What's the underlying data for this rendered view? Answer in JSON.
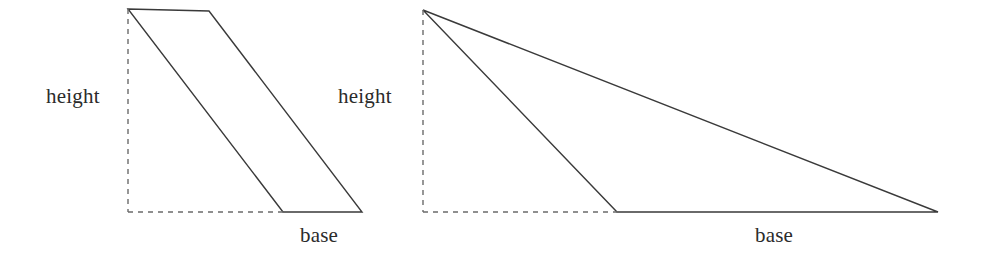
{
  "page": {
    "background_color": "#ffffff",
    "width": 983,
    "height": 262
  },
  "style": {
    "stroke_color": "#3a3a3a",
    "dashed_stroke_color": "#6b6b6b",
    "stroke_width": 1.4,
    "dash_pattern": "5,5",
    "label_color": "#2b2b2b",
    "label_font_size": 21
  },
  "figures": [
    {
      "id": "parallelogram",
      "name": "Parallelogram with base and height",
      "shape_type": "parallelogram",
      "vertices": [
        {
          "name": "top-left",
          "x": 128,
          "y": 9
        },
        {
          "name": "top-right",
          "x": 209,
          "y": 11
        },
        {
          "name": "bottom-right",
          "x": 362,
          "y": 212
        },
        {
          "name": "bottom-left",
          "x": 283,
          "y": 212
        }
      ],
      "height_line": {
        "x1": 128,
        "y1": 9,
        "x2": 128,
        "y2": 212,
        "dashed": true
      },
      "base_extension_line": {
        "x1": 128,
        "y1": 212,
        "x2": 283,
        "y2": 212,
        "dashed": true
      },
      "labels": {
        "height": "height",
        "base": "base"
      }
    },
    {
      "id": "obtuse-triangle",
      "name": "Obtuse triangle with base and external height",
      "shape_type": "triangle",
      "vertices": [
        {
          "name": "apex",
          "x": 423,
          "y": 10
        },
        {
          "name": "bottom-right",
          "x": 938,
          "y": 212
        },
        {
          "name": "bottom-left",
          "x": 617,
          "y": 212
        }
      ],
      "height_line": {
        "x1": 423,
        "y1": 10,
        "x2": 423,
        "y2": 212,
        "dashed": true
      },
      "base_extension_line": {
        "x1": 423,
        "y1": 212,
        "x2": 617,
        "y2": 212,
        "dashed": true
      },
      "labels": {
        "height": "height",
        "base": "base"
      }
    }
  ]
}
